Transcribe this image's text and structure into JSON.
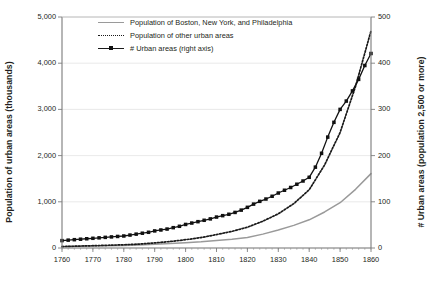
{
  "chart_data": {
    "type": "line",
    "title": "",
    "xlabel": "",
    "ylabel": "Population of urban areas (thousands)",
    "y2label": "# Urban areas (population 2,500 or more)",
    "xlim": [
      1760,
      1860
    ],
    "ylim": [
      0,
      5000
    ],
    "y2lim": [
      0,
      500
    ],
    "grid": true,
    "legend_position": "top-left inside plot",
    "xticks": [
      "1760",
      "1770",
      "1780",
      "1790",
      "1800",
      "1810",
      "1820",
      "1830",
      "1840",
      "1850",
      "1860"
    ],
    "yticks_left": [
      "0",
      "1,000",
      "2,000",
      "3,000",
      "4,000",
      "5,000"
    ],
    "yticks_right": [
      "0",
      "100",
      "200",
      "300",
      "400",
      "500"
    ],
    "minor_xtick_interval": 2,
    "series": [
      {
        "name": "Population of Boston, New York, and Philadelphia",
        "axis": "left",
        "style": "solid",
        "color": "#9a9a9a",
        "x": [
          1760,
          1765,
          1770,
          1775,
          1780,
          1785,
          1790,
          1795,
          1800,
          1805,
          1810,
          1815,
          1820,
          1825,
          1830,
          1835,
          1840,
          1845,
          1850,
          1855,
          1860
        ],
        "values": [
          35,
          40,
          45,
          50,
          55,
          65,
          80,
          95,
          115,
          135,
          165,
          190,
          225,
          300,
          390,
          490,
          610,
          780,
          980,
          1270,
          1610
        ]
      },
      {
        "name": "Population of other urban areas",
        "axis": "left",
        "style": "dotted",
        "color": "#1a1a1a",
        "x": [
          1760,
          1765,
          1770,
          1775,
          1780,
          1785,
          1790,
          1795,
          1800,
          1805,
          1810,
          1815,
          1820,
          1825,
          1830,
          1835,
          1840,
          1845,
          1850,
          1855,
          1860
        ],
        "values": [
          30,
          40,
          50,
          60,
          70,
          85,
          110,
          140,
          180,
          225,
          290,
          360,
          450,
          580,
          740,
          960,
          1260,
          1800,
          2500,
          3500,
          4700
        ]
      },
      {
        "name": "# Urban areas (right axis)",
        "axis": "right",
        "style": "solid-marker",
        "color": "#111111",
        "x": [
          1760,
          1762,
          1764,
          1766,
          1768,
          1770,
          1772,
          1774,
          1776,
          1778,
          1780,
          1782,
          1784,
          1786,
          1788,
          1790,
          1792,
          1794,
          1796,
          1798,
          1800,
          1802,
          1804,
          1806,
          1808,
          1810,
          1812,
          1814,
          1816,
          1818,
          1820,
          1822,
          1824,
          1826,
          1828,
          1830,
          1832,
          1834,
          1836,
          1838,
          1840,
          1842,
          1844,
          1846,
          1848,
          1850,
          1852,
          1854,
          1856,
          1858,
          1860
        ],
        "values": [
          16,
          17,
          18,
          19,
          20,
          21,
          22,
          23,
          24,
          25,
          26,
          28,
          30,
          32,
          34,
          37,
          39,
          41,
          44,
          47,
          51,
          54,
          57,
          60,
          63,
          67,
          70,
          73,
          77,
          82,
          88,
          95,
          101,
          106,
          112,
          119,
          125,
          131,
          138,
          145,
          153,
          175,
          205,
          240,
          272,
          300,
          318,
          340,
          365,
          395,
          421
        ]
      }
    ]
  },
  "legend": {
    "items": [
      {
        "label": "Population of Boston, New York, and Philadelphia",
        "key": "solid-gray-line-key"
      },
      {
        "label": "Population of other urban areas",
        "key": "dotted-black-line-key"
      },
      {
        "label": "# Urban areas (right axis)",
        "key": "marker-line-key"
      }
    ]
  }
}
